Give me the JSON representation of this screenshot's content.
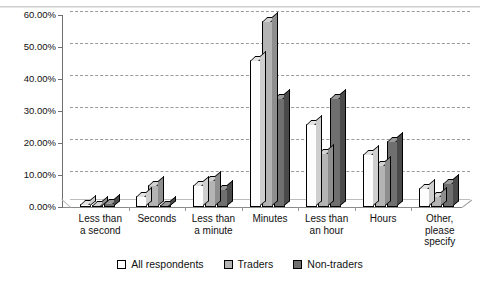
{
  "chart_data": {
    "type": "bar",
    "title": "",
    "xlabel": "",
    "ylabel": "",
    "ylim": [
      0,
      60
    ],
    "ytick_labels": [
      "60.00%",
      "50.00%",
      "40.00%",
      "30.00%",
      "20.00%",
      "10.00%",
      "0.00%"
    ],
    "ytick_values": [
      60,
      50,
      40,
      30,
      20,
      10,
      0
    ],
    "grid": true,
    "grid_style": "dashed-horizontal",
    "legend_position": "bottom-center",
    "three_d": true,
    "categories": [
      "Less than\na second",
      "Seconds",
      "Less than\na minute",
      "Minutes",
      "Less than\nan hour",
      "Hours",
      "Other,\nplease\nspecify"
    ],
    "series": [
      {
        "name": "All respondents",
        "color": "#ffffff",
        "values": [
          0.8,
          3.5,
          7.0,
          46.0,
          26.0,
          16.5,
          6.0
        ]
      },
      {
        "name": "Traders",
        "color": "#b4b4b4",
        "values": [
          0.6,
          7.0,
          8.5,
          58.0,
          17.0,
          13.0,
          3.5
        ]
      },
      {
        "name": "Non-traders",
        "color": "#6f6f6f",
        "values": [
          1.2,
          0.5,
          5.5,
          34.0,
          34.0,
          20.5,
          7.5
        ]
      }
    ]
  },
  "title_remnant": "",
  "legend": {
    "items": [
      {
        "label": "All respondents",
        "swatch": "white-square-icon"
      },
      {
        "label": "Traders",
        "swatch": "light-gray-square-icon"
      },
      {
        "label": "Non-traders",
        "swatch": "dark-gray-square-icon"
      }
    ]
  }
}
